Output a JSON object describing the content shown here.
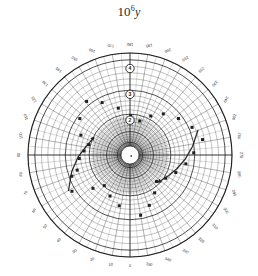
{
  "figure": {
    "title_mantissa": "10",
    "title_exponent": "6",
    "title_variable": "y",
    "title_full": "10^6 y",
    "background_color": "#ffffff",
    "ink_color": "#1f1f1f"
  },
  "chart_data": {
    "type": "scatter",
    "projection": "polar",
    "xlabel": "",
    "ylabel": "",
    "grid": true,
    "legend": null,
    "angular_axis": {
      "unit": "degrees",
      "direction": "counterclockwise",
      "zero_at": "bottom",
      "tick_step": 10,
      "tick_labels": [
        "0",
        "10",
        "20",
        "30",
        "40",
        "50",
        "60",
        "70",
        "80",
        "90",
        "100",
        "110",
        "120",
        "130",
        "140",
        "150",
        "160",
        "170",
        "180",
        "190",
        "200",
        "210",
        "220",
        "230",
        "240",
        "250",
        "260",
        "270",
        "280",
        "290",
        "300",
        "310",
        "320",
        "330",
        "340",
        "350"
      ]
    },
    "radial_axis": {
      "scale": "logarithmic",
      "decade_labels": [
        "2",
        "3",
        "4"
      ],
      "decade_label_style": "circled",
      "center_hole": true,
      "rlim": [
        1,
        4.6
      ],
      "minor_circles": 26
    },
    "series": [
      {
        "name": "points",
        "points": [
          {
            "theta": 58,
            "r": 3.3
          },
          {
            "theta": 70,
            "r": 3.05
          },
          {
            "theta": 74,
            "r": 2.78
          },
          {
            "theta": 86,
            "r": 2.62
          },
          {
            "theta": 95,
            "r": 2.44
          },
          {
            "theta": 104,
            "r": 2.3
          },
          {
            "theta": 112,
            "r": 2.7
          },
          {
            "theta": 126,
            "r": 3.05
          },
          {
            "theta": 141,
            "r": 3.32
          },
          {
            "theta": 152,
            "r": 2.95
          },
          {
            "theta": 166,
            "r": 2.52
          },
          {
            "theta": 181,
            "r": 2.18
          },
          {
            "theta": 196,
            "r": 2.02
          },
          {
            "theta": 208,
            "r": 2.36
          },
          {
            "theta": 219,
            "r": 2.7
          },
          {
            "theta": 233,
            "r": 3.0
          },
          {
            "theta": 246,
            "r": 3.28
          },
          {
            "theta": 258,
            "r": 3.52
          },
          {
            "theta": 268,
            "r": 3.12
          },
          {
            "theta": 279,
            "r": 2.84
          },
          {
            "theta": 291,
            "r": 2.55
          },
          {
            "theta": 303,
            "r": 2.3
          },
          {
            "theta": 315,
            "r": 2.1
          },
          {
            "theta": 327,
            "r": 2.4
          },
          {
            "theta": 339,
            "r": 2.74
          },
          {
            "theta": 350,
            "r": 3.02
          },
          {
            "theta": 12,
            "r": 2.66
          },
          {
            "theta": 26,
            "r": 2.42
          },
          {
            "theta": 40,
            "r": 2.2
          },
          {
            "theta": 48,
            "r": 2.58
          }
        ]
      },
      {
        "name": "track-lower-left",
        "kind": "curve",
        "points": [
          {
            "theta": 250,
            "r": 3.45
          },
          {
            "theta": 262,
            "r": 3.1
          },
          {
            "theta": 274,
            "r": 2.8
          },
          {
            "theta": 286,
            "r": 2.55
          },
          {
            "theta": 298,
            "r": 2.35
          },
          {
            "theta": 310,
            "r": 2.2
          }
        ]
      },
      {
        "name": "track-right",
        "kind": "curve",
        "points": [
          {
            "theta": 60,
            "r": 3.4
          },
          {
            "theta": 74,
            "r": 3.0
          },
          {
            "theta": 88,
            "r": 2.66
          },
          {
            "theta": 100,
            "r": 2.4
          },
          {
            "theta": 112,
            "r": 2.24
          }
        ]
      }
    ]
  }
}
